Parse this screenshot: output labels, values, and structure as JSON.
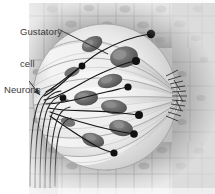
{
  "figure": {
    "background_color": "#ffffff",
    "width": 215,
    "height": 194
  },
  "labels": [
    {
      "id": "gustatory-cell",
      "line1": "Gustatory",
      "line2": "cell",
      "text": "Gustatory cell",
      "color": "#3a3a3a",
      "leader": "line",
      "points_to": "elongated pale cell inside taste bud"
    },
    {
      "id": "neurons",
      "line1": "Neurons",
      "line2": "",
      "text": "Neurons",
      "color": "#3a3a3a",
      "leader": "arrow",
      "points_to": "bundle of nerve fibers at lower left"
    }
  ],
  "structures": {
    "taste_bud": {
      "name": "taste bud",
      "shape": "ovoid",
      "fill": "#e7e7e7",
      "cell_count": 7
    },
    "epithelium": {
      "name": "stratified squamous epithelium",
      "fill": "#b9b9b9",
      "regions": [
        "top",
        "bottom",
        "right"
      ]
    },
    "taste_pore": {
      "name": "taste pore",
      "position": "right",
      "microvilli_count": 14
    },
    "nuclei": {
      "name": "gustatory cell nuclei",
      "fill": "#6e6e6e",
      "count": 7
    },
    "nerve_fibers": {
      "name": "afferent nerve fibers",
      "color": "#1a1a1a",
      "count": 7,
      "terminal": "synaptic bouton"
    }
  },
  "colors": {
    "ink": "#1a1a1a",
    "label_text": "#3a3a3a",
    "bud_light": "#f1f1f1",
    "bud_mid": "#d8d8d8",
    "bud_shade": "#a8a8a8",
    "epithelium": "#b4b4b4",
    "nucleus": "#6e6e6e"
  }
}
